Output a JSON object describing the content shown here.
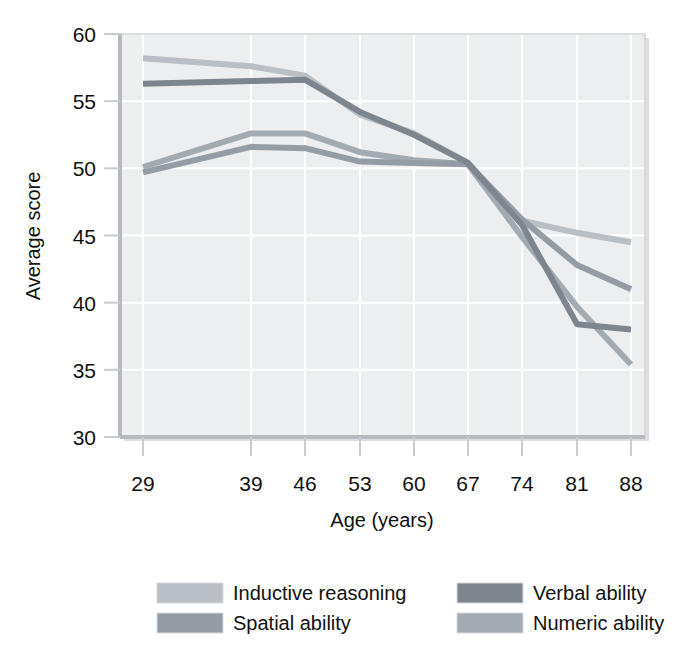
{
  "chart_data": {
    "type": "line",
    "title": "",
    "xlabel": "Age (years)",
    "ylabel": "Average score",
    "x": [
      29,
      39,
      46,
      53,
      60,
      67,
      74,
      81,
      88
    ],
    "xtick_labels": [
      "29",
      "39",
      "46",
      "53",
      "60",
      "67",
      "74",
      "81",
      "88"
    ],
    "ytick_labels": [
      "30",
      "35",
      "40",
      "45",
      "50",
      "55",
      "60"
    ],
    "xlim": [
      29,
      88
    ],
    "ylim": [
      30,
      60
    ],
    "grid": true,
    "legend_position": "bottom",
    "series": [
      {
        "name": "Inductive reasoning",
        "color": "#b9bfc4",
        "values": [
          58.2,
          57.6,
          56.9,
          54.0,
          52.6,
          50.4,
          46.1,
          45.2,
          44.5
        ]
      },
      {
        "name": "Spatial ability",
        "color": "#949da6",
        "values": [
          49.7,
          51.6,
          51.5,
          50.5,
          50.4,
          50.3,
          46.2,
          42.8,
          41.0
        ]
      },
      {
        "name": "Verbal ability",
        "color": "#7d868f",
        "values": [
          56.3,
          56.5,
          56.6,
          54.2,
          52.5,
          50.4,
          45.8,
          38.4,
          38.0
        ]
      },
      {
        "name": "Numeric ability",
        "color": "#a3abb2",
        "values": [
          50.1,
          52.6,
          52.6,
          51.2,
          50.6,
          50.3,
          44.9,
          39.7,
          35.4
        ]
      }
    ]
  },
  "legend": {
    "items": [
      {
        "label": "Inductive reasoning",
        "color": "#b9bfc4"
      },
      {
        "label": "Spatial ability",
        "color": "#949da6"
      },
      {
        "label": "Verbal ability",
        "color": "#7d868f"
      },
      {
        "label": "Numeric ability",
        "color": "#a3abb2"
      }
    ]
  },
  "colors": {
    "plot_background": "#eceef0",
    "gridline": "#ffffff",
    "axis": "#c9ccd0",
    "text": "#111111",
    "page_background": "#ffffff"
  }
}
